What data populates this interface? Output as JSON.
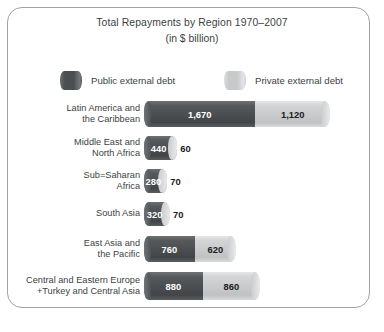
{
  "chart_data": {
    "type": "bar",
    "orientation": "horizontal",
    "stacked": true,
    "title": "Total Repayments by Region 1970–2007",
    "subtitle": "(in $ billion)",
    "xlabel": "",
    "ylabel": "",
    "unit": "$ billion",
    "grid": false,
    "legend_position": "top",
    "xlim": [
      0,
      2790
    ],
    "categories": [
      "Latin America and\nthe Caribbean",
      "Middle East and\nNorth Africa",
      "Sub=Saharan\nAfrica",
      "South Asia",
      "East Asia and\nthe Pacific",
      "Central and Eastern Europe\n+Turkey and Central Asia"
    ],
    "series": [
      {
        "name": "Public external debt",
        "color": "#4b4f51",
        "values": [
          1670,
          440,
          280,
          320,
          760,
          880
        ],
        "labels": [
          "1,670",
          "440",
          "280",
          "320",
          "760",
          "880"
        ]
      },
      {
        "name": "Private external debt",
        "color": "#c9cbcc",
        "values": [
          1120,
          60,
          70,
          70,
          620,
          860
        ],
        "labels": [
          "1,120",
          "60",
          "70",
          "70",
          "620",
          "860"
        ]
      }
    ],
    "totals": [
      2790,
      500,
      350,
      390,
      1380,
      1740
    ]
  },
  "legend": {
    "public": {
      "label": "Public external debt",
      "swatch": "dark-cylinder-swatch"
    },
    "private": {
      "label": "Private external debt",
      "swatch": "light-cylinder-swatch"
    }
  },
  "colors": {
    "public": "#4b4f51",
    "private": "#c9cbcc",
    "text": "#3b3f42",
    "frame": "#9fa3a6",
    "background": "#ffffff"
  }
}
